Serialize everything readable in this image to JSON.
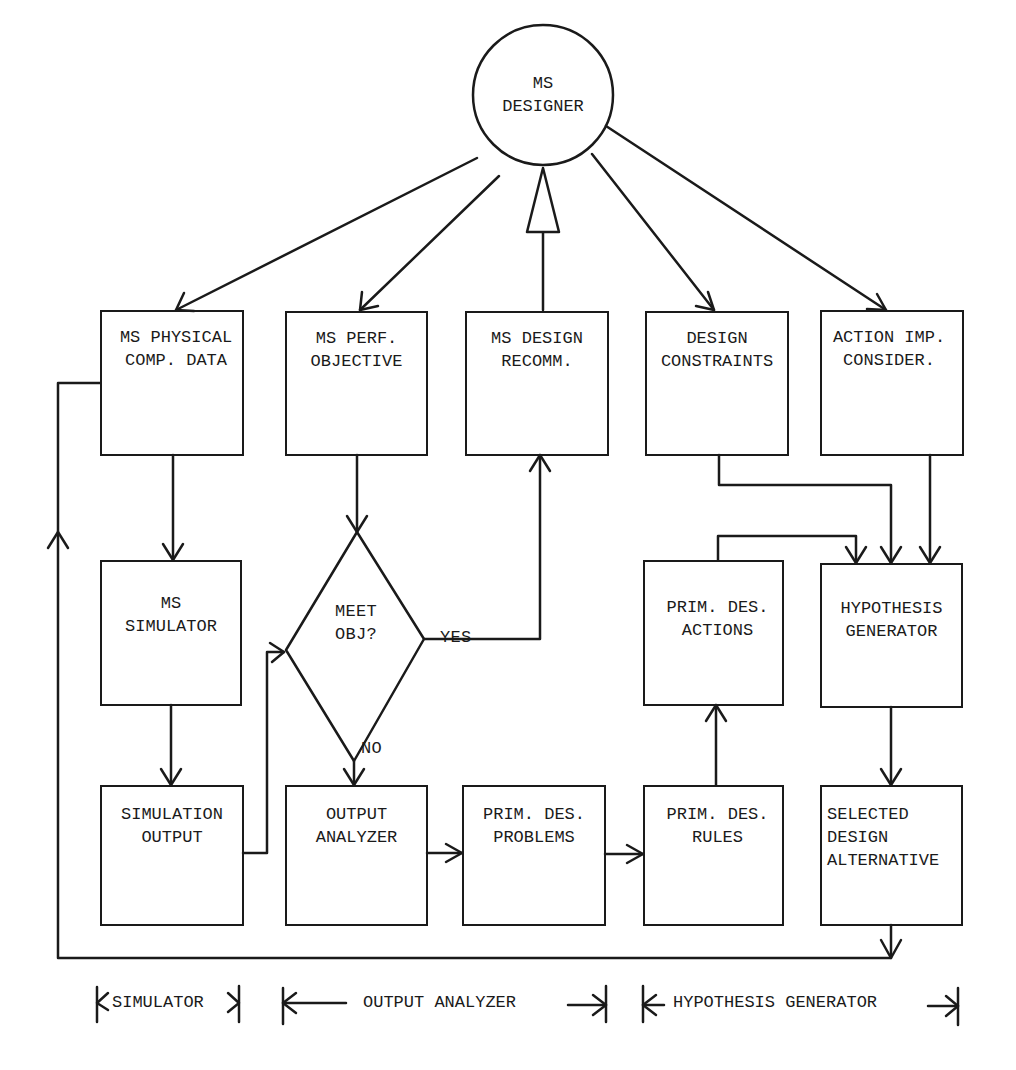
{
  "diagram": {
    "type": "flowchart",
    "root": {
      "id": "ms-designer",
      "label": "MS\nDESIGNER"
    },
    "row1": [
      {
        "id": "ms-physical-comp-data",
        "label": "MS PHYSICAL\nCOMP. DATA"
      },
      {
        "id": "ms-perf-objective",
        "label": "MS PERF.\nOBJECTIVE"
      },
      {
        "id": "ms-design-recomm",
        "label": "MS DESIGN\nRECOMM."
      },
      {
        "id": "design-constraints",
        "label": "DESIGN\nCONSTRAINTS"
      },
      {
        "id": "action-imp-consider",
        "label": "ACTION IMP.\nCONSIDER."
      }
    ],
    "row2": [
      {
        "id": "ms-simulator",
        "label": "MS\nSIMULATOR"
      },
      {
        "id": "meet-obj",
        "label": "MEET\nOBJ?",
        "shape": "diamond"
      },
      {
        "id": "prim-des-actions",
        "label": "PRIM. DES.\nACTIONS"
      },
      {
        "id": "hypothesis-generator",
        "label": "HYPOTHESIS\nGENERATOR"
      }
    ],
    "row3": [
      {
        "id": "simulation-output",
        "label": "SIMULATION\nOUTPUT"
      },
      {
        "id": "output-analyzer",
        "label": "OUTPUT\nANALYZER"
      },
      {
        "id": "prim-des-problems",
        "label": "PRIM. DES.\nPROBLEMS"
      },
      {
        "id": "prim-des-rules",
        "label": "PRIM. DES.\nRULES"
      },
      {
        "id": "selected-design-alternative",
        "label": "SELECTED\nDESIGN\nALTERNATIVE"
      }
    ],
    "edge_labels": {
      "yes": "YES",
      "no": "NO"
    },
    "edges": [
      [
        "ms-designer",
        "ms-physical-comp-data"
      ],
      [
        "ms-designer",
        "ms-perf-objective"
      ],
      [
        "ms-design-recomm",
        "ms-designer"
      ],
      [
        "ms-designer",
        "design-constraints"
      ],
      [
        "ms-designer",
        "action-imp-consider"
      ],
      [
        "ms-physical-comp-data",
        "ms-simulator"
      ],
      [
        "ms-simulator",
        "simulation-output"
      ],
      [
        "simulation-output",
        "meet-obj"
      ],
      [
        "ms-perf-objective",
        "meet-obj"
      ],
      [
        "meet-obj",
        "ms-design-recomm",
        "YES"
      ],
      [
        "meet-obj",
        "output-analyzer",
        "NO"
      ],
      [
        "output-analyzer",
        "prim-des-problems"
      ],
      [
        "prim-des-problems",
        "prim-des-rules"
      ],
      [
        "prim-des-rules",
        "prim-des-actions"
      ],
      [
        "prim-des-actions",
        "hypothesis-generator"
      ],
      [
        "design-constraints",
        "hypothesis-generator"
      ],
      [
        "action-imp-consider",
        "hypothesis-generator"
      ],
      [
        "hypothesis-generator",
        "selected-design-alternative"
      ],
      [
        "selected-design-alternative",
        "ms-physical-comp-data"
      ]
    ],
    "legend": {
      "simulator": "SIMULATOR",
      "output_analyzer": "OUTPUT ANALYZER",
      "hypothesis_generator": "HYPOTHESIS GENERATOR"
    },
    "colors": {
      "ink": "#1a1a1a",
      "paper": "#ffffff",
      "bleed": "#d8d8d8"
    }
  }
}
